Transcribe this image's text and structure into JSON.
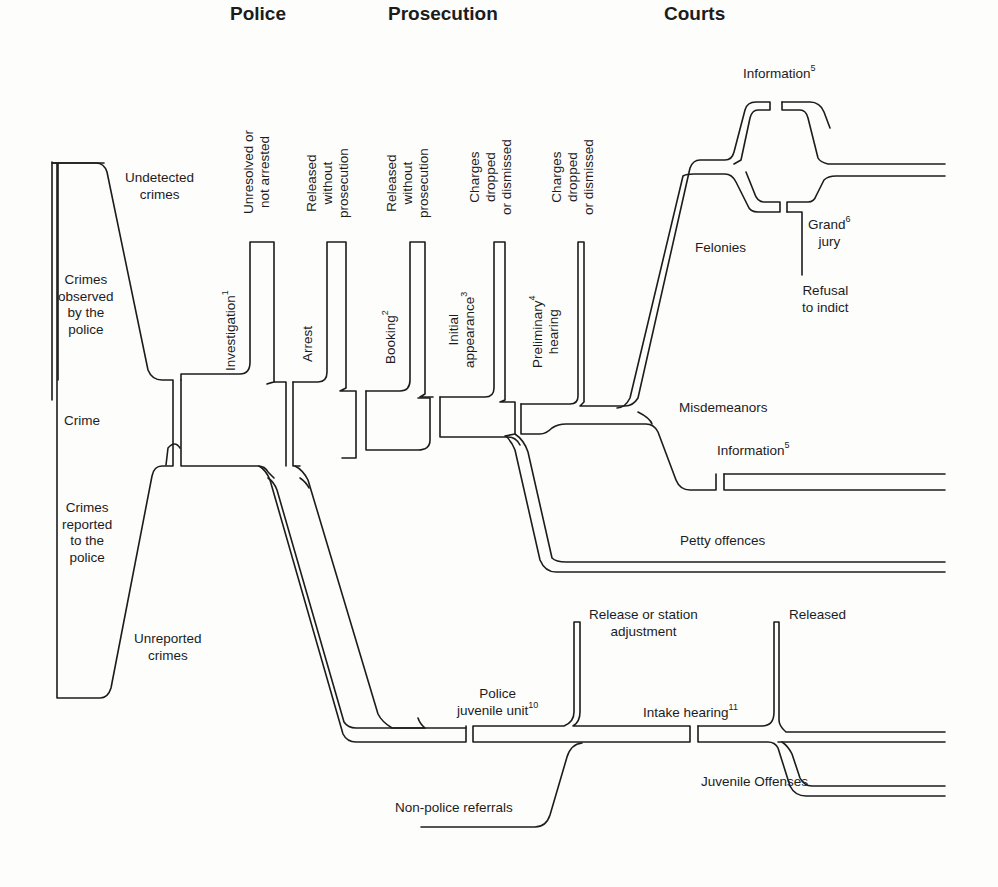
{
  "headers": {
    "police": "Police",
    "prosecution": "Prosecution",
    "courts": "Courts"
  },
  "entry": {
    "undetected": [
      "Undetected",
      "crimes"
    ],
    "observed": [
      "Crimes",
      "observed",
      "by the",
      "police"
    ],
    "crime": "Crime",
    "reported": [
      "Crimes",
      "reported",
      "to the",
      "police"
    ],
    "unreported": [
      "Unreported",
      "crimes"
    ]
  },
  "stages": {
    "investigation": {
      "label": "Investigation",
      "note": "1"
    },
    "arrest": {
      "label": "Arrest"
    },
    "booking": {
      "label": "Booking",
      "note": "2"
    },
    "initial_appearance": {
      "label": [
        "Initial",
        "appearance"
      ],
      "note": "3"
    },
    "preliminary_hearing": {
      "label": [
        "Preliminary",
        "hearing"
      ],
      "note": "4"
    }
  },
  "exits": {
    "unresolved": [
      "Unresolved or",
      "not arrested"
    ],
    "released1": [
      "Released",
      "without",
      "prosecution"
    ],
    "released2": [
      "Released",
      "without",
      "prosecution"
    ],
    "charges1": [
      "Charges",
      "dropped",
      "or dismissed"
    ],
    "charges2": [
      "Charges",
      "dropped",
      "or dismissed"
    ]
  },
  "courts": {
    "information_top": {
      "label": "Information",
      "note": "5"
    },
    "felonies": "Felonies",
    "grand_jury": {
      "label": [
        "Grand",
        "jury"
      ],
      "note": "6"
    },
    "refusal": [
      "Refusal",
      "to indict"
    ],
    "misdemeanors": "Misdemeanors",
    "information_mid": {
      "label": "Information",
      "note": "5"
    },
    "petty": "Petty offences"
  },
  "juvenile": {
    "release_station": [
      "Release or station",
      "adjustment"
    ],
    "police_unit": {
      "label": [
        "Police",
        "juvenile unit"
      ],
      "note": "10"
    },
    "intake": {
      "label": "Intake hearing",
      "note": "11"
    },
    "released": "Released",
    "non_police": "Non-police referrals",
    "offenses": "Juvenile Offenses"
  }
}
